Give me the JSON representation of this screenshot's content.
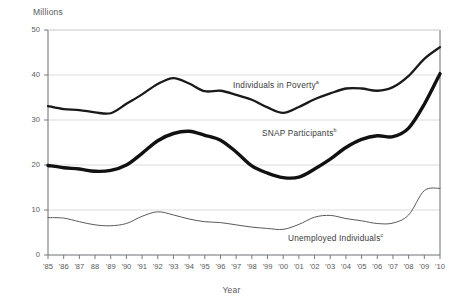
{
  "chart_data": {
    "type": "line",
    "title": "",
    "xlabel": "Year",
    "ylabel": "Millions",
    "xlim": [
      1985,
      2010
    ],
    "ylim": [
      0,
      50
    ],
    "grid": "horizontal",
    "legend_position": "inline-annotations",
    "categories": [
      "'85",
      "'86",
      "'87",
      "88",
      "'89",
      "'90",
      "'91",
      "'92",
      "'93",
      "'94",
      "'95",
      "'96",
      "'97",
      "'98",
      "'99",
      "'00",
      "'01",
      "'02",
      "'03",
      "'04",
      "'05",
      "'06",
      "'07",
      "'08",
      "'09",
      "'10"
    ],
    "x": [
      1985,
      1986,
      1987,
      1988,
      1989,
      1990,
      1991,
      1992,
      1993,
      1994,
      1995,
      1996,
      1997,
      1998,
      1999,
      2000,
      2001,
      2002,
      2003,
      2004,
      2005,
      2006,
      2007,
      2008,
      2009,
      2010
    ],
    "ytick_labels": [
      "0",
      "10",
      "20",
      "30",
      "40",
      "50"
    ],
    "ytick_values": [
      0,
      10,
      20,
      30,
      40,
      50
    ],
    "series": [
      {
        "name": "Individuals in Poverty",
        "footnote": "a",
        "label": "Individuals in Poverty",
        "color": "#1a1a1a",
        "width": 2.3,
        "values": [
          33.1,
          32.4,
          32.2,
          31.7,
          31.5,
          33.6,
          35.7,
          38.0,
          39.3,
          38.1,
          36.4,
          36.5,
          35.6,
          34.5,
          32.8,
          31.6,
          32.9,
          34.6,
          35.9,
          37.0,
          37.0,
          36.5,
          37.3,
          39.8,
          43.6,
          46.2
        ]
      },
      {
        "name": "SNAP Participants",
        "footnote": "b",
        "label": "SNAP Participants",
        "color": "#111111",
        "width": 3.4,
        "values": [
          19.9,
          19.4,
          19.1,
          18.6,
          18.8,
          20.0,
          22.6,
          25.4,
          27.0,
          27.5,
          26.6,
          25.5,
          22.9,
          19.8,
          18.2,
          17.2,
          17.3,
          19.1,
          21.3,
          23.9,
          25.7,
          26.5,
          26.3,
          28.2,
          33.5,
          40.3
        ]
      },
      {
        "name": "Unemployed Individuals",
        "footnote": "c",
        "label": "Unemployed Individuals",
        "color": "#58595b",
        "width": 1.0,
        "values": [
          8.3,
          8.2,
          7.4,
          6.7,
          6.5,
          7.0,
          8.6,
          9.6,
          8.9,
          8.0,
          7.4,
          7.2,
          6.7,
          6.2,
          5.9,
          5.7,
          6.8,
          8.4,
          8.8,
          8.1,
          7.6,
          7.0,
          7.1,
          8.9,
          14.3,
          14.8
        ]
      }
    ]
  },
  "axis": {
    "y_title": "Millions",
    "x_title": "Year"
  }
}
